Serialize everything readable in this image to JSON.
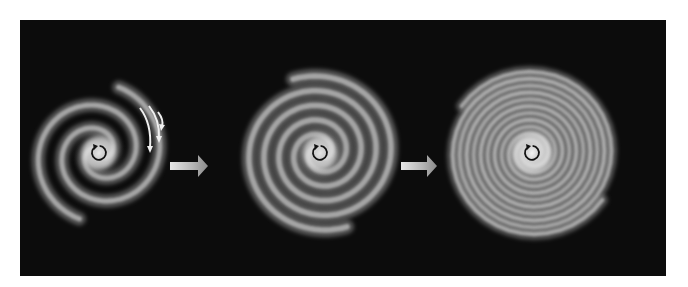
{
  "figure": {
    "background_color": "#0c0c0c",
    "stages": [
      {
        "id": "stage-1",
        "label": "open two-armed spiral",
        "arm_turns": 1.3,
        "rotation_marker": "counterclockwise-circular-arrow",
        "has_motion_arrows": true
      },
      {
        "id": "stage-2",
        "label": "tighter wound spiral",
        "arm_turns": 2.4,
        "rotation_marker": "counterclockwise-circular-arrow",
        "has_motion_arrows": false
      },
      {
        "id": "stage-3",
        "label": "tightly wound ring-like spiral",
        "arm_turns": 5.5,
        "rotation_marker": "counterclockwise-circular-arrow",
        "has_motion_arrows": false
      }
    ],
    "transition_arrows": [
      {
        "from": "stage-1",
        "to": "stage-2",
        "icon": "right-arrow"
      },
      {
        "from": "stage-2",
        "to": "stage-3",
        "icon": "right-arrow"
      }
    ],
    "motion_arrows": {
      "count": 3,
      "color": "#f0f0f0",
      "direction": "down-right"
    },
    "arm_color": "#bdbdbd",
    "core_color": "#f2f2f2"
  }
}
